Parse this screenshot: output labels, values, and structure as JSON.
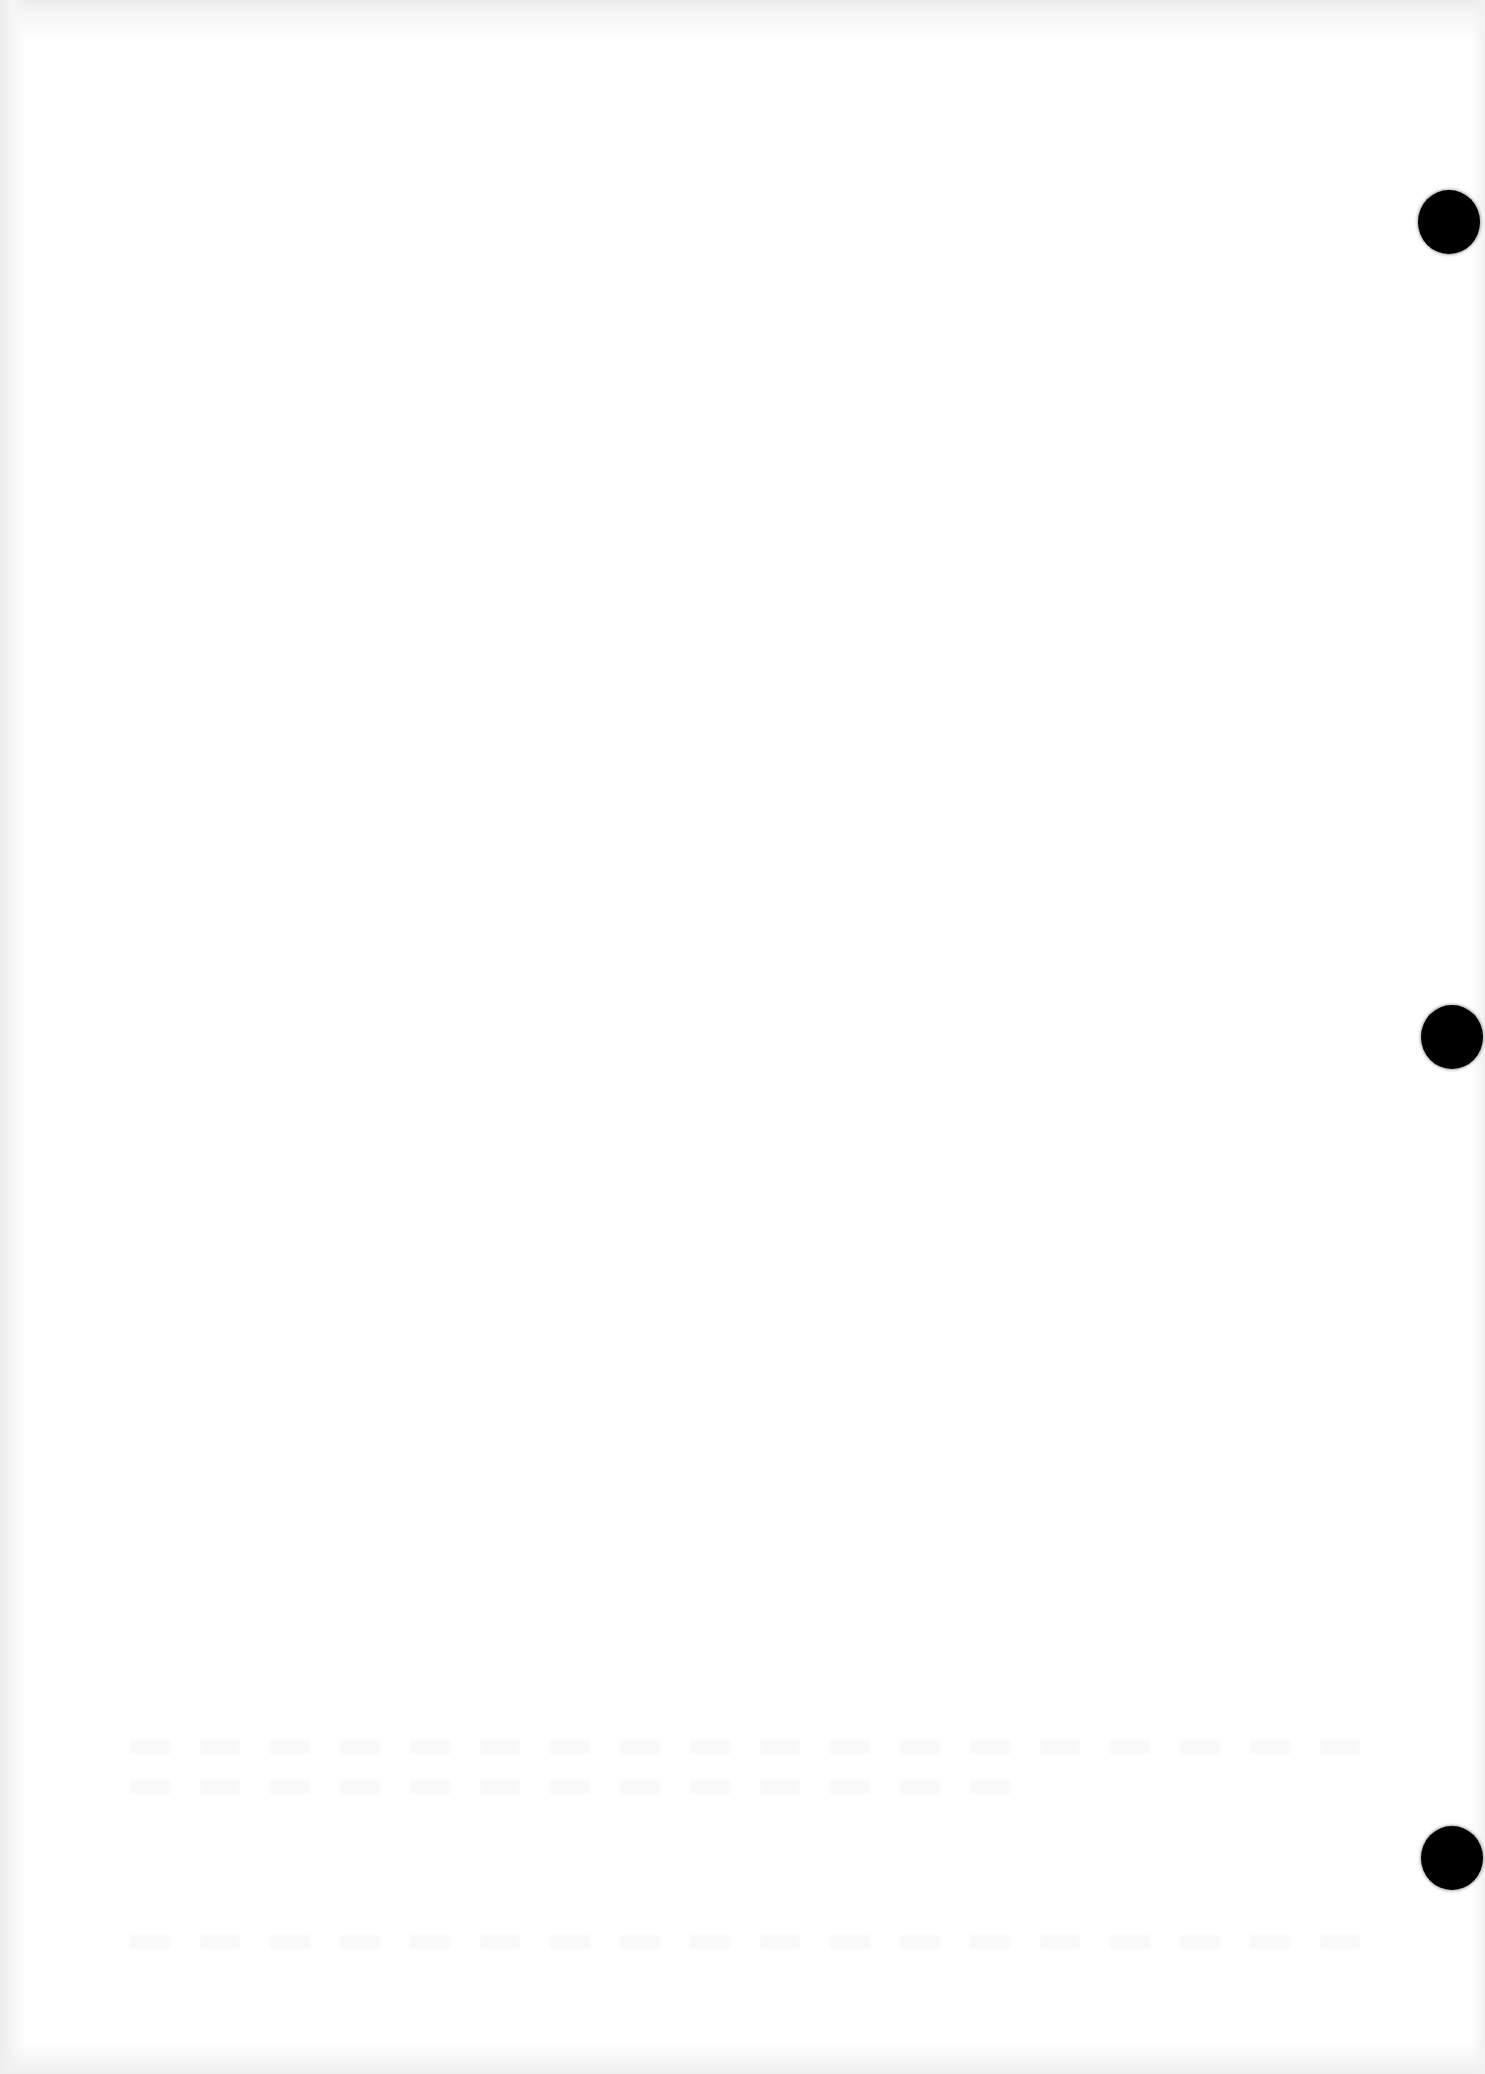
{
  "document": {
    "type": "scanned blank page",
    "text_content": "",
    "punch_holes": [
      {
        "x": 1449,
        "y": 222
      },
      {
        "x": 1452,
        "y": 1037
      },
      {
        "x": 1452,
        "y": 1858
      }
    ],
    "colors": {
      "paper": "#ffffff",
      "hole": "#000000",
      "scan_edge": "#ececec"
    }
  }
}
